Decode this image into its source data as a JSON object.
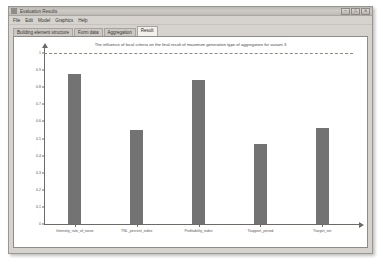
{
  "window": {
    "title": "Evaluation Results",
    "icon": "app-icon",
    "controls": [
      {
        "name": "minimize",
        "glyph": "─"
      },
      {
        "name": "maximize",
        "glyph": "□"
      },
      {
        "name": "close",
        "glyph": "✕"
      }
    ]
  },
  "menu": {
    "items": [
      "File",
      "Edit",
      "Model",
      "Graphics",
      "Help"
    ]
  },
  "tabs": {
    "items": [
      {
        "label": "Building element structure",
        "active": false
      },
      {
        "label": "Form data",
        "active": false
      },
      {
        "label": "Aggregation",
        "active": false
      },
      {
        "label": "Result",
        "active": true
      }
    ]
  },
  "chart_data": {
    "type": "bar",
    "title": "The influence of local criteria on the final result of maximum generation type of aggregation for variant 3",
    "categories": [
      "Intensity_rate_of_noise",
      "TNL_percent_index",
      "Profitability_index",
      "Tsupport_period",
      "Ttarget_set"
    ],
    "values": [
      0.88,
      0.55,
      0.84,
      0.47,
      0.56
    ],
    "xlabel": "",
    "ylabel": "",
    "ylim": [
      0,
      1
    ],
    "yticks": [
      "1",
      "0.9",
      "0.8",
      "0.7",
      "0.6",
      "0.5",
      "0.4",
      "0.3",
      "0.2",
      "0.1",
      "0"
    ],
    "ytick_values": [
      1,
      0.9,
      0.8,
      0.7,
      0.6,
      0.5,
      0.4,
      0.3,
      0.2,
      0.1,
      0
    ],
    "grid": false,
    "legend": "none",
    "reference_line": {
      "value": 1.0,
      "style": "dashed"
    },
    "bar_color": "#737373",
    "axis_color": "#6e6b67"
  }
}
